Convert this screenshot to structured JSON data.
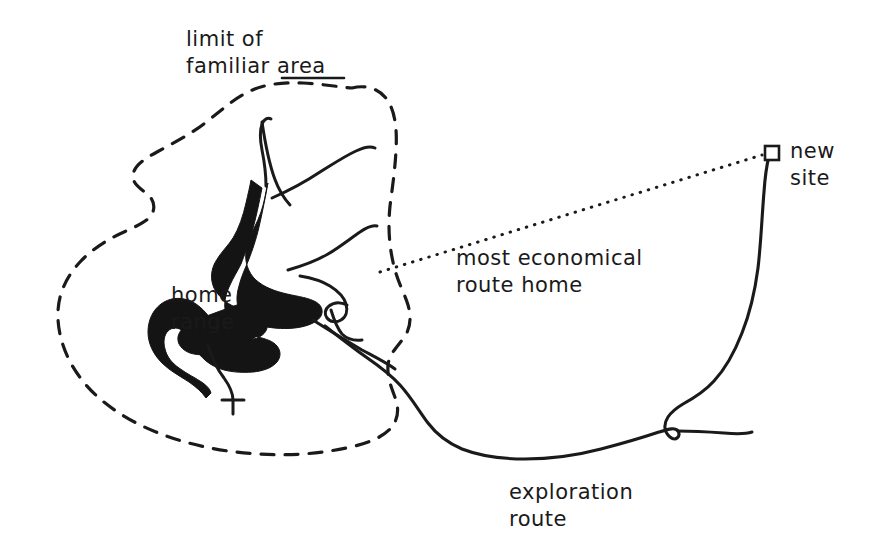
{
  "figure": {
    "background_color": "#ffffff",
    "ink_color": "#1a1a1a",
    "width": 874,
    "height": 556
  },
  "labels": {
    "familiar_area": "limit of\nfamiliar area",
    "home_range": "home\nrange",
    "economical_route": "most economical\nroute home",
    "exploration_route": "exploration\nroute",
    "new_site": "new\nsite"
  },
  "markers": {
    "new_site_symbol": "open-square"
  },
  "legend_semantics": [
    {
      "name": "limit-of-familiar-area",
      "style": "dashed-outline",
      "label": "limit of familiar area"
    },
    {
      "name": "home-range",
      "style": "solid-black-fill",
      "label": "home range"
    },
    {
      "name": "most-economical-route-home",
      "style": "dotted-straight-line",
      "label": "most economical route home"
    },
    {
      "name": "exploration-route",
      "style": "solid-wandering-line",
      "label": "exploration route"
    },
    {
      "name": "new-site",
      "style": "open-square-marker",
      "label": "new site"
    }
  ]
}
